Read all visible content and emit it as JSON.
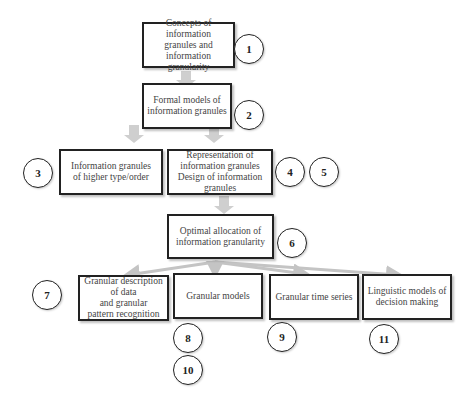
{
  "diagram": {
    "boxes": [
      {
        "id": "b1",
        "label": "Concepts of information\ngranules and information\ngranularity"
      },
      {
        "id": "b2",
        "label": "Formal models of\ninformation granules"
      },
      {
        "id": "b3",
        "label": "Information granules\nof higher type/order"
      },
      {
        "id": "b4",
        "label": "Representation of\ninformation granules\nDesign of information\ngranules"
      },
      {
        "id": "b6",
        "label": "Optimal allocation of\ninformation granularity"
      },
      {
        "id": "b7",
        "label": "Granular description of data\nand  granular\npattern recognition"
      },
      {
        "id": "b8",
        "label": "Granular models"
      },
      {
        "id": "b9",
        "label": "Granular time series"
      },
      {
        "id": "b11",
        "label": "Linguistic models of\ndecision making"
      }
    ],
    "chapter_numbers": [
      "1",
      "2",
      "3",
      "4",
      "5",
      "6",
      "7",
      "8",
      "9",
      "10",
      "11"
    ],
    "colors": {
      "arrow": "#c8c8c8",
      "border": "#222222"
    }
  }
}
